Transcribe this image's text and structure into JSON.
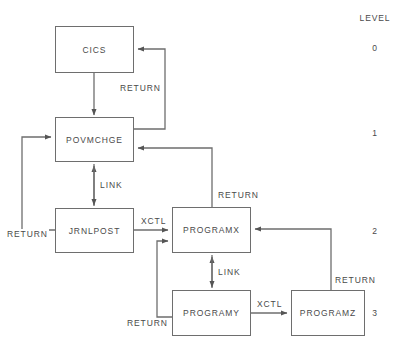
{
  "diagram": {
    "level_column": {
      "header": "LEVEL",
      "values": [
        "0",
        "1",
        "2",
        "3"
      ]
    },
    "nodes": [
      {
        "id": "cics",
        "label": "CICS",
        "level": "0"
      },
      {
        "id": "povmchge",
        "label": "POVMCHGE",
        "level": "1"
      },
      {
        "id": "jrnlpost",
        "label": "JRNLPOST",
        "level": "2"
      },
      {
        "id": "programx",
        "label": "PROGRAMX",
        "level": "2"
      },
      {
        "id": "programy",
        "label": "PROGRAMY",
        "level": "3"
      },
      {
        "id": "programz",
        "label": "PROGRAMZ",
        "level": "3"
      }
    ],
    "edges": [
      {
        "id": "cics-to-povmchge",
        "from": "cics",
        "to": "povmchge",
        "label": ""
      },
      {
        "id": "povmchge-to-cics",
        "from": "povmchge",
        "to": "cics",
        "label": "RETURN"
      },
      {
        "id": "povmchge-jrnlpost",
        "from": "povmchge",
        "to": "jrnlpost",
        "label": "LINK"
      },
      {
        "id": "jrnlpost-to-povmchge",
        "from": "jrnlpost",
        "to": "povmchge",
        "label": "RETURN"
      },
      {
        "id": "jrnlpost-to-programx",
        "from": "jrnlpost",
        "to": "programx",
        "label": "XCTL"
      },
      {
        "id": "programx-to-povmchge",
        "from": "programx",
        "to": "povmchge",
        "label": "RETURN"
      },
      {
        "id": "programx-programy",
        "from": "programx",
        "to": "programy",
        "label": "LINK"
      },
      {
        "id": "programy-to-programx",
        "from": "programy",
        "to": "programx",
        "label": "RETURN"
      },
      {
        "id": "programy-to-programz",
        "from": "programy",
        "to": "programz",
        "label": "XCTL"
      },
      {
        "id": "programz-to-programx",
        "from": "programz",
        "to": "programx",
        "label": "RETURN"
      }
    ],
    "colors": {
      "line": "#6e6e6e",
      "text": "#4a4a4a",
      "background": "#ffffff"
    }
  }
}
